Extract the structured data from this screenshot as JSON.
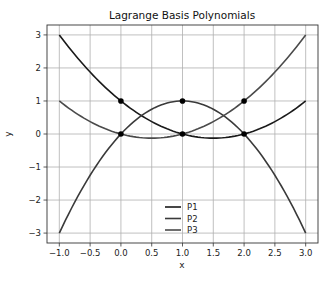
{
  "chart_data": {
    "type": "line",
    "title": "Lagrange Basis Polynomials",
    "xlabel": "x",
    "ylabel": "y",
    "xlim": [
      -1.2,
      3.2
    ],
    "ylim": [
      -3.3,
      3.3
    ],
    "x_ticks": [
      -1.0,
      -0.5,
      0.0,
      0.5,
      1.0,
      1.5,
      2.0,
      2.5,
      3.0
    ],
    "x_tick_labels": [
      "−1.0",
      "−0.5",
      "0.0",
      "0.5",
      "1.0",
      "1.5",
      "2.0",
      "2.5",
      "3.0"
    ],
    "y_ticks": [
      -3,
      -2,
      -1,
      0,
      1,
      2,
      3
    ],
    "y_tick_labels": [
      "−3",
      "−2",
      "−1",
      "0",
      "1",
      "2",
      "3"
    ],
    "grid": true,
    "legend_position": "lower center",
    "x": [
      -1.0,
      -0.5,
      0.0,
      0.5,
      1.0,
      1.5,
      2.0,
      2.5,
      3.0
    ],
    "series": [
      {
        "name": "P1",
        "color": "#1a1a1a",
        "formula": "(x-1)(x-2)/2",
        "values": [
          3.0,
          1.875,
          1.0,
          0.375,
          0.0,
          -0.125,
          0.0,
          0.375,
          1.0
        ]
      },
      {
        "name": "P2",
        "color": "#3a3a3a",
        "formula": "-x(x-2)",
        "values": [
          -3.0,
          -1.25,
          0.0,
          0.75,
          1.0,
          0.75,
          0.0,
          -1.25,
          -3.0
        ]
      },
      {
        "name": "P3",
        "color": "#4a4a4a",
        "formula": "x(x-1)/2",
        "values": [
          1.0,
          0.375,
          0.0,
          -0.125,
          0.0,
          0.375,
          1.0,
          1.875,
          3.0
        ]
      }
    ],
    "markers": [
      {
        "x": 0,
        "y": 1
      },
      {
        "x": 0,
        "y": 0
      },
      {
        "x": 1,
        "y": 1
      },
      {
        "x": 1,
        "y": 0
      },
      {
        "x": 2,
        "y": 1
      },
      {
        "x": 2,
        "y": 0
      }
    ]
  }
}
